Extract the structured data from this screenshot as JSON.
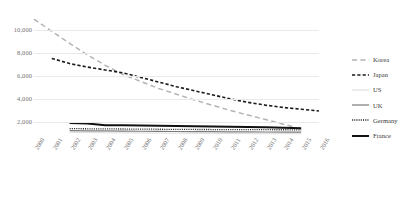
{
  "chart_data": {
    "type": "line",
    "title": "",
    "xlabel": "",
    "ylabel": "",
    "ylim": [
      0,
      11000
    ],
    "yticks": [
      10000,
      8000,
      6000,
      4000,
      2000
    ],
    "ytick_labels": [
      "10,000",
      "8,000",
      "6,000",
      "4,000",
      "2,000"
    ],
    "grid": true,
    "legend_position": "right",
    "x": [
      2000,
      2001,
      2002,
      2003,
      2004,
      2005,
      2006,
      2007,
      2008,
      2009,
      2010,
      2011,
      2012,
      2013,
      2014,
      2015,
      2016
    ],
    "xtick_labels": [
      "2000",
      "2001",
      "2002",
      "2003",
      "2004",
      "2005",
      "2006",
      "2007",
      "2008",
      "2009",
      "2010",
      "2011",
      "2012",
      "2013",
      "2014",
      "2015",
      "2016"
    ],
    "series": [
      {
        "name": "Korea",
        "style": "long-dash",
        "color": "#b4b4b4",
        "width": 1.5,
        "x": [
          2000,
          2001,
          2002,
          2003,
          2004,
          2005,
          2006,
          2007,
          2008,
          2009,
          2010,
          2011,
          2012,
          2013,
          2014,
          2015
        ],
        "values": [
          10900,
          9850,
          8800,
          7800,
          6900,
          6100,
          5500,
          4900,
          4400,
          3900,
          3450,
          3000,
          2600,
          2200,
          1800,
          1400
        ]
      },
      {
        "name": "Japan",
        "style": "dash",
        "color": "#1a1a1a",
        "width": 1.6,
        "x": [
          2001,
          2002,
          2003,
          2004,
          2005,
          2006,
          2007,
          2008,
          2009,
          2010,
          2011,
          2012,
          2013,
          2014,
          2015,
          2016
        ],
        "values": [
          7500,
          7050,
          6750,
          6500,
          6250,
          5850,
          5450,
          5050,
          4700,
          4350,
          4000,
          3700,
          3450,
          3250,
          3100,
          2950
        ]
      },
      {
        "name": "US",
        "style": "solid",
        "color": "#dcdcdc",
        "width": 1.0,
        "x": [
          2002,
          2003,
          2004,
          2005,
          2006,
          2007,
          2008,
          2009,
          2010,
          2011,
          2012,
          2013,
          2014,
          2015
        ],
        "values": [
          1100,
          1080,
          1060,
          1050,
          1040,
          1030,
          1020,
          1010,
          1000,
          990,
          985,
          980,
          975,
          970
        ]
      },
      {
        "name": "UK",
        "style": "solid",
        "color": "#7a7a7a",
        "width": 1.2,
        "x": [
          2002,
          2003,
          2004,
          2005,
          2006,
          2007,
          2008,
          2009,
          2010,
          2011,
          2012,
          2013,
          2014,
          2015
        ],
        "values": [
          1250,
          1230,
          1215,
          1200,
          1190,
          1180,
          1170,
          1160,
          1150,
          1140,
          1130,
          1125,
          1120,
          1115
        ]
      },
      {
        "name": "Germany",
        "style": "dot",
        "color": "#2b2b2b",
        "width": 1.3,
        "x": [
          2002,
          2003,
          2004,
          2005,
          2006,
          2007,
          2008,
          2009,
          2010,
          2011,
          2012,
          2013,
          2014,
          2015
        ],
        "values": [
          1420,
          1405,
          1395,
          1385,
          1375,
          1365,
          1355,
          1345,
          1340,
          1335,
          1330,
          1325,
          1320,
          1315
        ]
      },
      {
        "name": "France",
        "style": "solid",
        "color": "#111111",
        "width": 2.0,
        "x": [
          2002,
          2003,
          2004,
          2005,
          2006,
          2007,
          2008,
          2009,
          2010,
          2011,
          2012,
          2013,
          2014,
          2015
        ],
        "values": [
          1900,
          1860,
          1720,
          1700,
          1680,
          1660,
          1640,
          1620,
          1600,
          1580,
          1560,
          1540,
          1500,
          1460
        ]
      }
    ]
  },
  "legend": {
    "items": [
      {
        "label": "Korea"
      },
      {
        "label": "Japan"
      },
      {
        "label": "US"
      },
      {
        "label": "UK"
      },
      {
        "label": "Germany"
      },
      {
        "label": "France"
      }
    ]
  }
}
